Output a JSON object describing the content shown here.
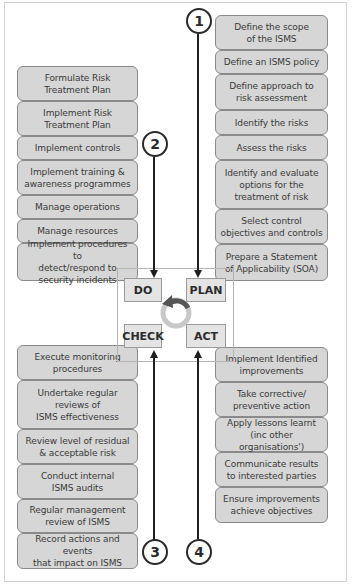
{
  "diagram": {
    "type": "PDCA cycle for ISMS",
    "phases": {
      "do": "DO",
      "plan": "PLAN",
      "check": "CHECK",
      "act": "ACT"
    },
    "step_numbers": [
      "1",
      "2",
      "3",
      "4"
    ],
    "plan_steps": [
      "Define the scope\nof the ISMS",
      "Define an ISMS policy",
      "Define approach to\nrisk assessment",
      "Identify the risks",
      "Assess the risks",
      "Identify and evaluate\noptions for the\ntreatment of risk",
      "Select control\nobjectives and controls",
      "Prepare a Statement\nof Applicability (SOA)"
    ],
    "do_steps": [
      "Formulate Risk\nTreatment Plan",
      "Implement Risk\nTreatment Plan",
      "Implement controls",
      "Implement training &\nawareness programmes",
      "Manage operations",
      "Manage resources",
      "Implement procedures to\ndetect/respond to\nsecurity incidents"
    ],
    "check_steps": [
      "Execute monitoring\nprocedures",
      "Undertake regular\nreviews of\nISMS effectiveness",
      "Review level of residual\n& acceptable risk",
      "Conduct internal\nISMS audits",
      "Regular management\nreview of ISMS",
      "Record actions and events\nthat impact on ISMS"
    ],
    "act_steps": [
      "Implement Identified\nimprovements",
      "Take corrective/\npreventive action",
      "Apply lessons learnt\n(inc other organisations')",
      "Communicate results\nto interested parties",
      "Ensure improvements\nachieve objectives"
    ],
    "colors": {
      "box_fill": "#d6d6d6",
      "box_border": "#8a8a8a",
      "phase_fill": "#e4e4e4",
      "line": "#1e1e1e",
      "cycle_ring": "#c8c8c8",
      "cycle_arrow": "#555555"
    }
  }
}
